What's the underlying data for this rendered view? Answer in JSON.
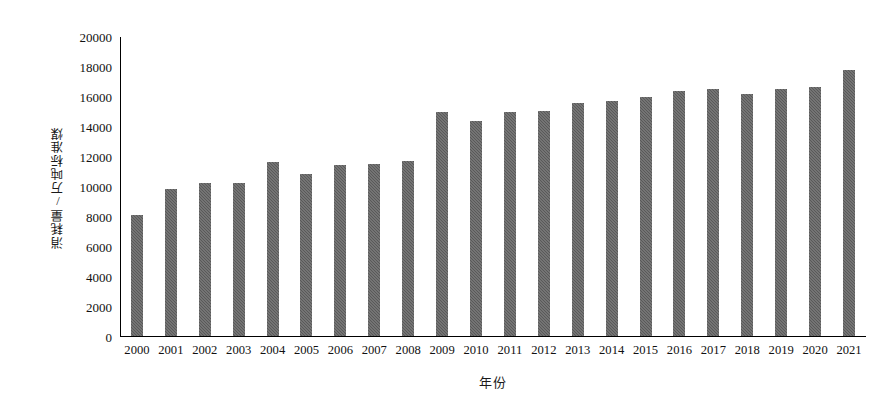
{
  "chart_data": {
    "type": "bar",
    "title": "",
    "xlabel": "年份",
    "ylabel": "消耗量/万吨标准煤",
    "categories": [
      "2000",
      "2001",
      "2002",
      "2003",
      "2004",
      "2005",
      "2006",
      "2007",
      "2008",
      "2009",
      "2010",
      "2011",
      "2012",
      "2013",
      "2014",
      "2015",
      "2016",
      "2017",
      "2018",
      "2019",
      "2020",
      "2021"
    ],
    "values": [
      8100,
      9800,
      10200,
      10200,
      11600,
      10800,
      11400,
      11500,
      11700,
      14950,
      14400,
      14950,
      15050,
      15600,
      15700,
      16000,
      16400,
      16550,
      16200,
      16550,
      16650,
      17800
    ],
    "ylim": [
      0,
      20000
    ],
    "yticks": [
      0,
      2000,
      4000,
      6000,
      8000,
      10000,
      12000,
      14000,
      16000,
      18000,
      20000
    ],
    "ytick_labels": [
      "0",
      "2000",
      "4000",
      "6000",
      "8000",
      "10000",
      "12000",
      "14000",
      "16000",
      "18000",
      "20000"
    ],
    "grid": false,
    "legend": null,
    "series_color": "#595959"
  }
}
